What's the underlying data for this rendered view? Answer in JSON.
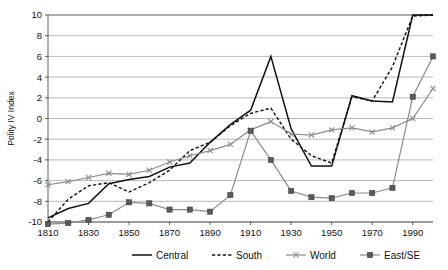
{
  "chart_data": {
    "type": "line",
    "title": "",
    "xlabel": "",
    "ylabel": "Polity IV Index",
    "ylim": [
      -10,
      10
    ],
    "xlim": [
      1810,
      2000
    ],
    "yticks": [
      -10,
      -8,
      -6,
      -4,
      -2,
      0,
      2,
      4,
      6,
      8,
      10
    ],
    "xticks": [
      1810,
      1830,
      1850,
      1870,
      1890,
      1910,
      1930,
      1950,
      1970,
      1990
    ],
    "grid": "horizontal",
    "legend_position": "bottom",
    "x": [
      1810,
      1820,
      1830,
      1840,
      1850,
      1860,
      1870,
      1880,
      1890,
      1900,
      1910,
      1920,
      1930,
      1940,
      1950,
      1960,
      1970,
      1980,
      1990,
      2000
    ],
    "series": [
      {
        "name": "Central",
        "style": "solid",
        "color": "#111111",
        "marker": "none",
        "values": [
          -9.6,
          -8.7,
          -8.2,
          -6.3,
          -5.9,
          -5.6,
          -4.7,
          -4.3,
          -2.3,
          -0.6,
          0.8,
          6.0,
          -1.0,
          -4.6,
          -4.6,
          2.2,
          1.7,
          1.6,
          10.0,
          10.0
        ]
      },
      {
        "name": "South",
        "style": "dashed",
        "color": "#111111",
        "marker": "none",
        "values": [
          -10.0,
          -7.8,
          -6.5,
          -6.2,
          -7.1,
          -6.2,
          -5.0,
          -3.1,
          -2.3,
          -0.7,
          0.5,
          1.0,
          -2.0,
          -3.6,
          -4.3,
          2.1,
          1.7,
          5.0,
          9.9,
          10.0
        ]
      },
      {
        "name": "World",
        "style": "solid",
        "color": "#8c8c8c",
        "marker": "x",
        "values": [
          -6.4,
          -6.1,
          -5.7,
          -5.3,
          -5.4,
          -5.0,
          -4.2,
          -3.6,
          -3.1,
          -2.5,
          -1.1,
          -0.3,
          -1.5,
          -1.6,
          -1.1,
          -0.9,
          -1.3,
          -0.9,
          0.0,
          2.9
        ]
      },
      {
        "name": "East/SE",
        "style": "solid",
        "color": "#8c8c8c",
        "marker": "square",
        "values": [
          -10.2,
          -10.1,
          -9.8,
          -9.3,
          -8.1,
          -8.2,
          -8.8,
          -8.8,
          -9.0,
          -7.4,
          -1.2,
          -4.0,
          -7.0,
          -7.6,
          -7.7,
          -7.2,
          -7.2,
          -6.7,
          2.1,
          6.0
        ]
      }
    ]
  },
  "legend": {
    "items": [
      {
        "label": "Central"
      },
      {
        "label": "South"
      },
      {
        "label": "World"
      },
      {
        "label": "East/SE"
      }
    ]
  }
}
